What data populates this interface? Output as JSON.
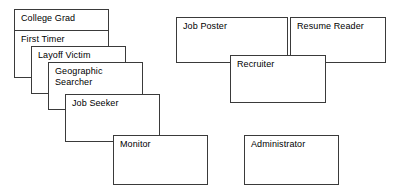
{
  "diagram": {
    "background_color": "#ffffff",
    "border_color": "#3a3a3a",
    "text_color": "#000000",
    "nodes": [
      {
        "id": "college-grad",
        "label": "College Grad",
        "x": 14,
        "y": 9,
        "width": 95,
        "height": 22
      },
      {
        "id": "first-timer",
        "label": "First Timer",
        "x": 14,
        "y": 30,
        "width": 95,
        "height": 48
      },
      {
        "id": "layoff-victim",
        "label": "Layoff Victim",
        "x": 31,
        "y": 46,
        "width": 95,
        "height": 48
      },
      {
        "id": "geographic-searcher",
        "label": "Geographic\nSearcher",
        "x": 48,
        "y": 62,
        "width": 95,
        "height": 48
      },
      {
        "id": "job-seeker",
        "label": "Job Seeker",
        "x": 65,
        "y": 94,
        "width": 95,
        "height": 48
      },
      {
        "id": "monitor",
        "label": "Monitor",
        "x": 113,
        "y": 135,
        "width": 95,
        "height": 50
      },
      {
        "id": "job-poster",
        "label": "Job Poster",
        "x": 176,
        "y": 17,
        "width": 112,
        "height": 46
      },
      {
        "id": "resume-reader",
        "label": "Resume Reader",
        "x": 290,
        "y": 17,
        "width": 96,
        "height": 46
      },
      {
        "id": "recruiter",
        "label": "Recruiter",
        "x": 230,
        "y": 55,
        "width": 96,
        "height": 48
      },
      {
        "id": "administrator",
        "label": "Administrator",
        "x": 244,
        "y": 135,
        "width": 95,
        "height": 50
      }
    ]
  }
}
